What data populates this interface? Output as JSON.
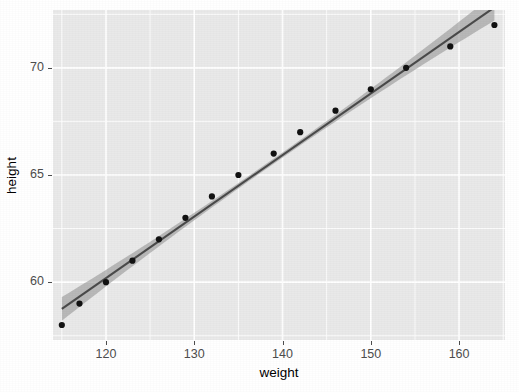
{
  "chart_data": {
    "type": "scatter",
    "title": "",
    "subtitle": "",
    "xlabel": "weight",
    "ylabel": "height",
    "xlim": [
      114.0,
      165.2
    ],
    "ylim": [
      57.3,
      72.7
    ],
    "x_ticks": [
      120,
      130,
      140,
      150,
      160
    ],
    "x_tick_labels": [
      "120",
      "130",
      "140",
      "150",
      "160"
    ],
    "y_ticks": [
      60,
      65,
      70
    ],
    "y_tick_labels": [
      "60",
      "65",
      "70"
    ],
    "x_minor_ticks": [
      115,
      125,
      135,
      145,
      155,
      165
    ],
    "y_minor_ticks": [
      57.5,
      62.5,
      67.5,
      72.5
    ],
    "grid": "major-and-minor",
    "legend": "none",
    "points": [
      {
        "x": 115,
        "y": 58
      },
      {
        "x": 117,
        "y": 59
      },
      {
        "x": 120,
        "y": 60
      },
      {
        "x": 123,
        "y": 61
      },
      {
        "x": 126,
        "y": 62
      },
      {
        "x": 129,
        "y": 63
      },
      {
        "x": 132,
        "y": 64
      },
      {
        "x": 135,
        "y": 65
      },
      {
        "x": 139,
        "y": 66
      },
      {
        "x": 142,
        "y": 67
      },
      {
        "x": 146,
        "y": 68
      },
      {
        "x": 150,
        "y": 69
      },
      {
        "x": 154,
        "y": 70
      },
      {
        "x": 159,
        "y": 71
      },
      {
        "x": 164,
        "y": 72
      }
    ],
    "series": [
      {
        "name": "height",
        "x": [
          115,
          117,
          120,
          123,
          126,
          129,
          132,
          135,
          139,
          142,
          146,
          150,
          154,
          159,
          164
        ],
        "values": [
          58,
          59,
          60,
          61,
          62,
          63,
          64,
          65,
          66,
          67,
          68,
          69,
          70,
          71,
          72
        ]
      }
    ],
    "fit": {
      "type": "linear-regression",
      "method": "lm",
      "intercept": 25.7235,
      "slope": 0.2872,
      "x_start": 115,
      "x_end": 164,
      "y_start": 58.75,
      "y_end": 72.82,
      "line_color": "#4a4a4a",
      "ribbon_color": "#9a9a9a",
      "confidence_level": 0.95,
      "ribbon_half_width_at_x_start": 0.55,
      "ribbon_half_width_at_x_mid": 0.12,
      "ribbon_half_width_at_x_end": 0.62
    },
    "colors": {
      "panel_background": "#e9e9e9",
      "grid_line": "#ffffff",
      "point": "#121212",
      "fit_line": "#4a4a4a",
      "ribbon": "#9a9a9a",
      "axis_text": "#4d4d4d",
      "axis_title": "#000000",
      "plot_background": "#ffffff"
    }
  },
  "axes": {
    "x_title": "weight",
    "y_title": "height"
  }
}
